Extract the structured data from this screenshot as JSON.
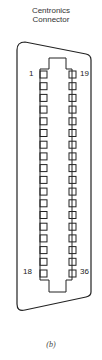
{
  "title": {
    "line1": "Centronics",
    "line2": "Connector"
  },
  "connector": {
    "pins_per_row": 18,
    "total_pins": 36,
    "pin_labels": {
      "left_top": "1",
      "right_top": "19",
      "left_bottom": "18",
      "right_bottom": "36"
    },
    "stroke_color": "#222222"
  },
  "caption": "(b)"
}
